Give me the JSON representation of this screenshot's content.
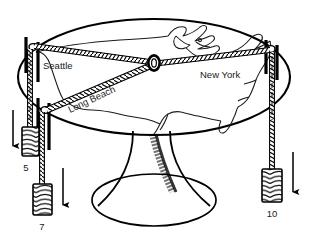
{
  "figure": {
    "background_color": "#ffffff",
    "ink_color": "#000000",
    "width": 309,
    "height": 236
  },
  "table": {
    "name": "round pedestal table with United States map",
    "top_shape": "ellipse",
    "map_label": "United States outline",
    "pedestal_label": "pedestal base"
  },
  "hub": {
    "label": "center ring",
    "description": "small ring where the three cords join"
  },
  "cities": [
    {
      "id": "seattle",
      "label": "Seattle",
      "weight": "5",
      "post": "post-seattle"
    },
    {
      "id": "long-beach",
      "label": "Long Beach",
      "weight": "7",
      "post": "post-long-beach"
    },
    {
      "id": "new-york",
      "label": "New York",
      "weight": "10",
      "post": "post-new-york"
    }
  ],
  "weights": [
    {
      "id": "w5",
      "label": "5",
      "arrow": "down-arrow",
      "cord": "hatched cord"
    },
    {
      "id": "w7",
      "label": "7",
      "arrow": "down-arrow",
      "cord": "hatched cord"
    },
    {
      "id": "w10",
      "label": "10",
      "arrow": "down-arrow",
      "cord": "hatched cord"
    }
  ],
  "arrows": {
    "direction": "down",
    "meaning": "gravitational pull of the hanging weight"
  }
}
